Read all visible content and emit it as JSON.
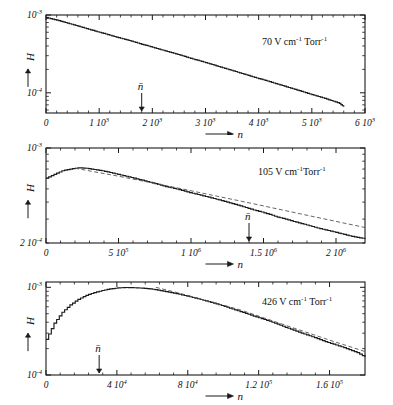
{
  "figure": {
    "type": "multi-panel-line-chart",
    "panel_count": 3,
    "background": "#ffffff",
    "line_color": "#1a1a1a",
    "fit_color": "#555555"
  },
  "chart_data": [
    {
      "type": "line",
      "panel_index": 0,
      "title": "",
      "annotation": "70 V cm⁻¹ Torr⁻¹",
      "annotation_value": "70",
      "annotation_unit": "V cm",
      "annotation_exp1": "-1",
      "annotation_unit2": " Torr",
      "annotation_exp2": "-1",
      "xlabel": "n",
      "ylabel": "H",
      "xscale": "linear",
      "yscale": "log",
      "xlim": [
        0,
        6000
      ],
      "ylim": [
        5.5e-05,
        0.001
      ],
      "grid": false,
      "xticks": [
        0,
        1000,
        2000,
        3000,
        4000,
        5000,
        6000
      ],
      "xticklabels": [
        "0",
        "1 10³",
        "2 10³",
        "3 10³",
        "4 10³",
        "5 10³",
        "6 10³"
      ],
      "xticklabels_parts": [
        {
          "mantissa": "0",
          "exp": ""
        },
        {
          "mantissa": "1 10",
          "exp": "3"
        },
        {
          "mantissa": "2 10",
          "exp": "3"
        },
        {
          "mantissa": "3 10",
          "exp": "3"
        },
        {
          "mantissa": "4 10",
          "exp": "3"
        },
        {
          "mantissa": "5 10",
          "exp": "3"
        },
        {
          "mantissa": "6 10",
          "exp": "3"
        }
      ],
      "yticks": [
        0.001,
        0.0001
      ],
      "yticklabels_parts": [
        {
          "mantissa": "10",
          "exp": "-3"
        },
        {
          "mantissa": "10",
          "exp": "-4"
        }
      ],
      "mean_marker": {
        "label": "n̄",
        "x": 1800,
        "arrow": "down"
      },
      "series": [
        {
          "name": "H(n) histogram",
          "style": "step-solid",
          "x": [
            0,
            120,
            240,
            360,
            480,
            600,
            720,
            840,
            960,
            1080,
            1200,
            1320,
            1440,
            1560,
            1680,
            1800,
            1920,
            2040,
            2160,
            2280,
            2400,
            2520,
            2640,
            2760,
            2880,
            3000,
            3120,
            3240,
            3360,
            3480,
            3600,
            3720,
            3840,
            3960,
            4080,
            4200,
            4320,
            4440,
            4560,
            4680,
            4800,
            4920,
            5040,
            5160,
            5280,
            5400,
            5520,
            5600
          ],
          "y": [
            0.00093,
            0.000885,
            0.000845,
            0.0008,
            0.00076,
            0.00072,
            0.00068,
            0.000645,
            0.00061,
            0.00058,
            0.00055,
            0.00052,
            0.000495,
            0.00047,
            0.000445,
            0.00042,
            0.0004,
            0.000378,
            0.000358,
            0.00034,
            0.000322,
            0.000305,
            0.000288,
            0.000272,
            0.000258,
            0.000244,
            0.000231,
            0.000218,
            0.000206,
            0.000195,
            0.000184,
            0.000174,
            0.000164,
            0.000155,
            0.000147,
            0.000139,
            0.000131,
            0.000124,
            0.000117,
            0.0001105,
            0.0001045,
            9.85e-05,
            9.3e-05,
            8.8e-05,
            8.3e-05,
            7.8e-05,
            7.3e-05,
            6.6e-05
          ]
        }
      ]
    },
    {
      "type": "line",
      "panel_index": 1,
      "title": "",
      "annotation": "105 V cm⁻¹ Torr⁻¹",
      "annotation_value": "105",
      "annotation_unit": "V cm",
      "annotation_exp1": "-1",
      "annotation_unit2": "Torr",
      "annotation_exp2": "-1",
      "xlabel": "n",
      "ylabel": "H",
      "xscale": "linear",
      "yscale": "log",
      "xlim": [
        0,
        2200000
      ],
      "ylim": [
        0.0002,
        0.001
      ],
      "grid": false,
      "xticks": [
        0,
        500000,
        1000000,
        1500000,
        2000000
      ],
      "xticklabels": [
        "0",
        "5 10⁵",
        "1 10⁶",
        "1.5 10⁶",
        "2 10⁶"
      ],
      "xticklabels_parts": [
        {
          "mantissa": "0",
          "exp": ""
        },
        {
          "mantissa": "5 10",
          "exp": "5"
        },
        {
          "mantissa": "1 10",
          "exp": "6"
        },
        {
          "mantissa": "1.5 10",
          "exp": "6"
        },
        {
          "mantissa": "2 10",
          "exp": "6"
        }
      ],
      "yticks": [
        0.001,
        0.0002
      ],
      "yticklabels_parts": [
        {
          "mantissa": "10",
          "exp": "-3"
        },
        {
          "mantissa": "2 10",
          "exp": "-4"
        }
      ],
      "mean_marker": {
        "label": "n̄",
        "x": 1400000,
        "arrow": "down"
      },
      "series": [
        {
          "name": "H(n) histogram",
          "style": "step-solid",
          "x": [
            0,
            55000,
            110000,
            165000,
            220000,
            275000,
            330000,
            385000,
            440000,
            495000,
            550000,
            605000,
            660000,
            715000,
            770000,
            825000,
            880000,
            935000,
            990000,
            1045000,
            1100000,
            1155000,
            1210000,
            1265000,
            1320000,
            1375000,
            1430000,
            1485000,
            1540000,
            1595000,
            1650000,
            1705000,
            1760000,
            1815000,
            1870000,
            1925000,
            1980000,
            2035000,
            2090000,
            2145000,
            2200000
          ],
          "y": [
            0.0006,
            0.00064,
            0.00068,
            0.0007,
            0.000715,
            0.00071,
            0.000695,
            0.00068,
            0.00066,
            0.00064,
            0.00062,
            0.0006,
            0.00058,
            0.00056,
            0.00054,
            0.00052,
            0.000505,
            0.000488,
            0.00047,
            0.000455,
            0.00044,
            0.000425,
            0.00041,
            0.000395,
            0.00038,
            0.000365,
            0.00035,
            0.000338,
            0.000325,
            0.00031,
            0.0003,
            0.000288,
            0.000278,
            0.000268,
            0.000258,
            0.00025,
            0.000242,
            0.000234,
            0.000226,
            0.00022,
            0.000215
          ]
        },
        {
          "name": "exponential fit",
          "style": "dashed",
          "x": [
            200000,
            500000,
            900000,
            1400000,
            1800000,
            2200000
          ],
          "y": [
            0.00071,
            0.00062,
            0.00051,
            0.000395,
            0.00032,
            0.00026
          ]
        }
      ]
    },
    {
      "type": "line",
      "panel_index": 2,
      "title": "",
      "annotation": "426 V cm⁻¹ Torr⁻¹",
      "annotation_value": "426",
      "annotation_unit": "V cm",
      "annotation_exp1": "-1",
      "annotation_unit2": " Torr",
      "annotation_exp2": "-1",
      "xlabel": "n",
      "ylabel": "H",
      "xscale": "linear",
      "yscale": "log",
      "xlim": [
        0,
        180000
      ],
      "ylim": [
        0.0001,
        0.00115
      ],
      "grid": false,
      "xticks": [
        0,
        40000,
        80000,
        120000,
        160000
      ],
      "xticklabels": [
        "0",
        "4 10⁴",
        "8 10⁴",
        "1.2 10⁵",
        "1.6 10⁵"
      ],
      "xticklabels_parts": [
        {
          "mantissa": "0",
          "exp": ""
        },
        {
          "mantissa": "4 10",
          "exp": "4"
        },
        {
          "mantissa": "8 10",
          "exp": "4"
        },
        {
          "mantissa": "1.2 10",
          "exp": "5"
        },
        {
          "mantissa": "1.6 10",
          "exp": "5"
        }
      ],
      "yticks": [
        0.001,
        0.0001
      ],
      "yticklabels_parts": [
        {
          "mantissa": "10",
          "exp": "-3"
        },
        {
          "mantissa": "10",
          "exp": "-4"
        }
      ],
      "mean_marker": {
        "label": "n̄",
        "x": 30000,
        "arrow": "down"
      },
      "series": [
        {
          "name": "H(n) histogram",
          "style": "step-solid",
          "x": [
            0,
            4500,
            9000,
            13500,
            18000,
            22500,
            27000,
            31500,
            36000,
            40500,
            45000,
            49500,
            54000,
            58500,
            63000,
            67500,
            72000,
            76500,
            81000,
            85500,
            90000,
            94500,
            99000,
            103500,
            108000,
            112500,
            117000,
            121500,
            126000,
            130500,
            135000,
            139500,
            144000,
            148500,
            153000,
            157500,
            162000,
            166500,
            171000,
            175500,
            180000
          ],
          "y": [
            0.000255,
            0.00039,
            0.00052,
            0.00063,
            0.00073,
            0.00081,
            0.00087,
            0.00092,
            0.00096,
            0.000985,
            0.000995,
            0.00099,
            0.00098,
            0.00096,
            0.00093,
            0.000895,
            0.00086,
            0.00082,
            0.00078,
            0.00074,
            0.0007,
            0.00066,
            0.00062,
            0.00058,
            0.00054,
            0.000505,
            0.00047,
            0.00044,
            0.00041,
            0.00038,
            0.00035,
            0.000325,
            0.0003,
            0.00028,
            0.00026,
            0.00024,
            0.000225,
            0.00021,
            0.000195,
            0.00018,
            0.00016
          ]
        },
        {
          "name": "exponential fit",
          "style": "dashed",
          "x": [
            62000,
            75000,
            90000,
            110000,
            135000,
            160000,
            180000
          ],
          "y": [
            0.001,
            0.00086,
            0.00071,
            0.00055,
            0.00037,
            0.00025,
            0.000185
          ]
        }
      ]
    }
  ]
}
